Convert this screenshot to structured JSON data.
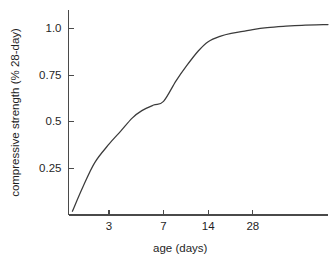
{
  "chart_data": {
    "type": "line",
    "title": "",
    "xlabel": "age (days)",
    "ylabel": "compressive strength (% 28-day)",
    "xscale": "log",
    "yscale": "linear",
    "grid": false,
    "legend": null,
    "xticks": [
      3,
      7,
      14,
      28
    ],
    "xtick_labels": [
      "3",
      "7",
      "14",
      "28"
    ],
    "yticks": [
      0.25,
      0.5,
      0.75,
      1.0
    ],
    "ytick_labels": [
      "0.25",
      "0.5",
      "0.75",
      "1.0"
    ],
    "xlim": [
      1.6,
      90
    ],
    "ylim": [
      0,
      1.1
    ],
    "series": [
      {
        "name": "compressive strength development",
        "color": "#3b3b3b",
        "x": [
          1.7,
          2.0,
          2.4,
          3.0,
          3.6,
          4.3,
          5.0,
          6.0,
          7.0,
          8.5,
          10.0,
          12.0,
          14.0,
          17.0,
          20.0,
          24.0,
          28.0,
          35.0,
          45.0,
          60.0,
          90.0
        ],
        "y": [
          0.02,
          0.15,
          0.28,
          0.38,
          0.45,
          0.52,
          0.56,
          0.59,
          0.61,
          0.72,
          0.8,
          0.88,
          0.93,
          0.96,
          0.975,
          0.985,
          0.995,
          1.005,
          1.012,
          1.018,
          1.022
        ]
      }
    ]
  },
  "axes": {
    "y_axis_name": "y-axis",
    "x_axis_name": "x-axis"
  }
}
